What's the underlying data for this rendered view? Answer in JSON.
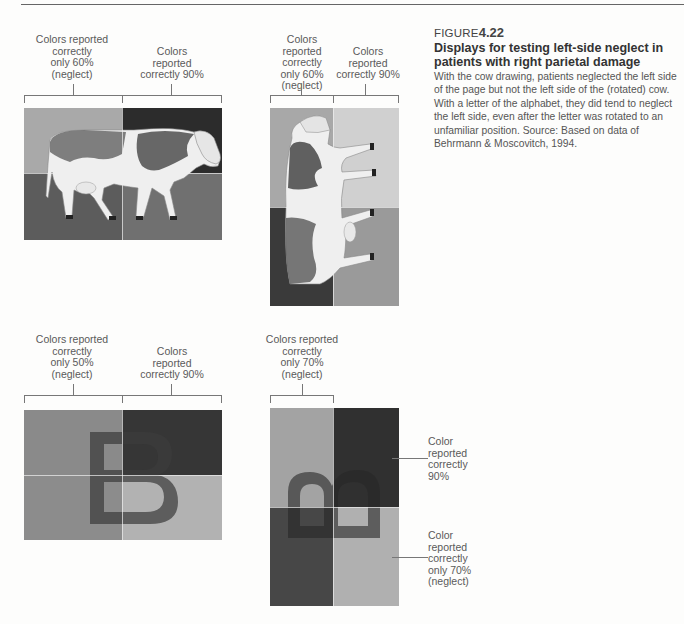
{
  "figure": {
    "label": "FIGURE",
    "number": "4.22",
    "title": "Displays for testing left-side neglect in patients with right parietal damage",
    "body": "With the cow drawing, patients neglected the left side of the page but not the left side of the (rotated) cow. With a letter of the alphabet, they did tend to neglect the left side, even after the letter was rotated to an unfamiliar position.   Source: Based on data of Behrmann & Moscovitch, 1994."
  },
  "panels": {
    "cow_upright": {
      "left_label": "Colors reported\ncorrectly\nonly 60%\n(neglect)",
      "right_label": "Colors\nreported\ncorrectly 90%",
      "quadrant_colors": {
        "top_left": "#a9a9a9",
        "top_right": "#2c2c2c",
        "bottom_left": "#5c5c5c",
        "bottom_right": "#707070"
      }
    },
    "cow_rotated": {
      "left_label": "Colors reported\ncorrectly\nonly 60%\n(neglect)",
      "right_label": "Colors\nreported\ncorrectly 90%",
      "quadrant_colors": {
        "top_left": "#a8a8a8",
        "top_right": "#d0d0d0",
        "bottom_left": "#3a3a3a",
        "bottom_right": "#9a9a9a"
      }
    },
    "letter_upright": {
      "letter": "B",
      "left_label": "Colors reported\ncorrectly\nonly 50%\n(neglect)",
      "right_label": "Colors\nreported\ncorrectly 90%",
      "quadrant_colors": {
        "top_left": "#8a8a8a",
        "top_right": "#363636",
        "bottom_left": "#8c8c8c",
        "bottom_right": "#b2b2b2"
      }
    },
    "letter_rotated": {
      "letter": "B",
      "top_label": "Colors reported\ncorrectly\nonly 70%\n(neglect)",
      "right_top_label": "Color\nreported\ncorrectly\n90%",
      "right_bottom_label": "Color\nreported\ncorrectly\nonly 70%\n(neglect)",
      "quadrant_colors": {
        "top_left": "#a3a3a3",
        "top_right": "#303030",
        "bottom_left": "#474747",
        "bottom_right": "#b0b0b0"
      }
    }
  }
}
